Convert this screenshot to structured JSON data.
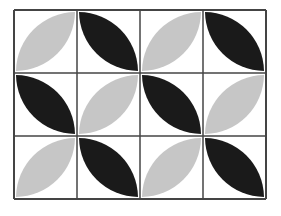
{
  "diagram": {
    "type": "tiling-pattern",
    "grid": {
      "rows": 3,
      "cols": 4
    },
    "colors": {
      "light": "#c6c6c6",
      "dark": "#1a1a1a",
      "line": "#444444",
      "background": "#ffffff"
    },
    "cells": [
      [
        "light-up",
        "dark-down",
        "light-up",
        "dark-down"
      ],
      [
        "dark-down",
        "light-up",
        "dark-down",
        "light-up"
      ],
      [
        "light-up",
        "dark-down",
        "light-up",
        "dark-down"
      ]
    ]
  }
}
